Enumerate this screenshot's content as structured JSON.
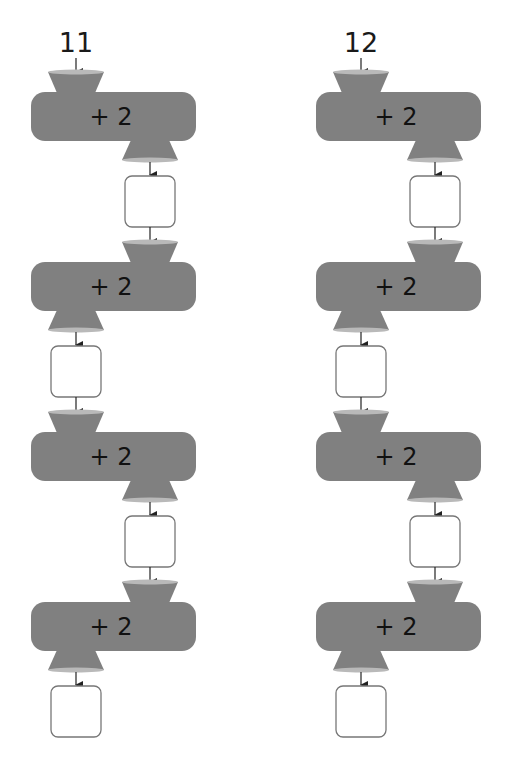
{
  "chains": [
    {
      "start": "11",
      "offset_x": 0,
      "machines": [
        {
          "op": "+ 2",
          "in_side": "left",
          "out_side": "right",
          "output": ""
        },
        {
          "op": "+ 2",
          "in_side": "right",
          "out_side": "left",
          "output": ""
        },
        {
          "op": "+ 2",
          "in_side": "left",
          "out_side": "right",
          "output": ""
        },
        {
          "op": "+ 2",
          "in_side": "right",
          "out_side": "left",
          "output": ""
        }
      ]
    },
    {
      "start": "12",
      "offset_x": 285,
      "machines": [
        {
          "op": "+ 2",
          "in_side": "left",
          "out_side": "right",
          "output": ""
        },
        {
          "op": "+ 2",
          "in_side": "right",
          "out_side": "left",
          "output": ""
        },
        {
          "op": "+ 2",
          "in_side": "left",
          "out_side": "right",
          "output": ""
        },
        {
          "op": "+ 2",
          "in_side": "right",
          "out_side": "left",
          "output": ""
        }
      ]
    }
  ],
  "colors": {
    "machine": "#808080",
    "funnel_rim": "#b9b9b9",
    "box_border": "#777777",
    "arrow": "#222222"
  }
}
